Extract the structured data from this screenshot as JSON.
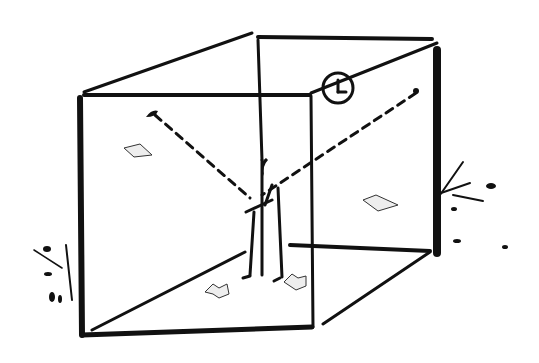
{
  "illustration": {
    "description": "Ink sketch of a transparent cube room with a standing figure holding a dashed cord stretched between two corners; clock on top edge; books on floor; papers on walls; plants outside the cube",
    "colors": {
      "ink": "#111111",
      "background": "#ffffff",
      "paper": "#eeeeee"
    },
    "elements": [
      "cube-frame",
      "clock",
      "dashed-cord",
      "figure",
      "book-left",
      "book-right",
      "paper-left-wall",
      "paper-right-wall",
      "plant-left",
      "plant-right"
    ]
  }
}
